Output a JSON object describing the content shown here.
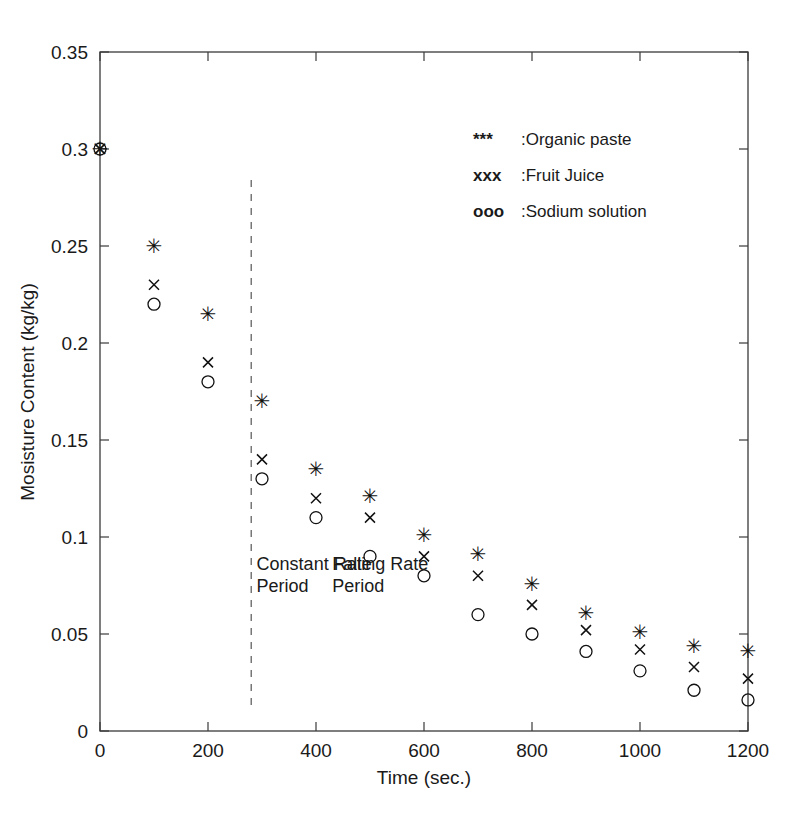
{
  "chart_data": {
    "type": "scatter",
    "title": "",
    "xlabel": "Time (sec.)",
    "ylabel": "Mosisture Content (kg/kg)",
    "xlim": [
      0,
      1200
    ],
    "ylim": [
      0,
      0.35
    ],
    "xticks": [
      0,
      200,
      400,
      600,
      800,
      1000,
      1200
    ],
    "xtick_labels": [
      "0",
      "200",
      "400",
      "600",
      "800",
      "1000",
      "1200"
    ],
    "yticks": [
      0,
      0.05,
      0.1,
      0.15,
      0.2,
      0.25,
      0.3,
      0.35
    ],
    "ytick_labels": [
      "0",
      "0.05",
      "0.1",
      "0.15",
      "0.2",
      "0.25",
      "0.3",
      "0.35"
    ],
    "grid": false,
    "legend_position": "upper right",
    "x": [
      0,
      100,
      200,
      300,
      400,
      500,
      600,
      700,
      800,
      900,
      1000,
      1100,
      1200
    ],
    "series": [
      {
        "name": "Organic paste",
        "marker": "star",
        "legend_symbol": "***",
        "legend_label": ":Organic paste",
        "values": [
          0.3,
          0.25,
          0.215,
          0.17,
          0.135,
          0.121,
          0.101,
          0.091,
          0.076,
          0.061,
          0.051,
          0.044,
          0.041
        ]
      },
      {
        "name": "Fruit Juice",
        "marker": "cross",
        "legend_symbol": "xxx",
        "legend_label": ":Fruit Juice",
        "values": [
          0.3,
          0.23,
          0.19,
          0.14,
          0.12,
          0.11,
          0.09,
          0.08,
          0.065,
          0.052,
          0.042,
          0.033,
          0.027
        ]
      },
      {
        "name": "Sodium solution",
        "marker": "circle",
        "legend_symbol": "ooo",
        "legend_label": ":Sodium solution",
        "values": [
          0.3,
          0.22,
          0.18,
          0.13,
          0.11,
          0.09,
          0.08,
          0.06,
          0.05,
          0.041,
          0.031,
          0.021,
          0.016
        ]
      }
    ],
    "annotations": [
      {
        "id": "constant-rate",
        "line1": "Constant Rate",
        "line2": "Period",
        "x": 290,
        "y": 0.083
      },
      {
        "id": "falling-rate",
        "line1": "Falling Rate",
        "line2": "Period",
        "x": 430,
        "y": 0.083
      }
    ],
    "divider": {
      "x": 280,
      "label": "constant-to-falling-rate-boundary"
    }
  },
  "colors": {
    "marker": "#111111",
    "axis": "#3a3a3a",
    "divider": "#555555",
    "text": "#1a1a1a",
    "background": "#ffffff"
  }
}
